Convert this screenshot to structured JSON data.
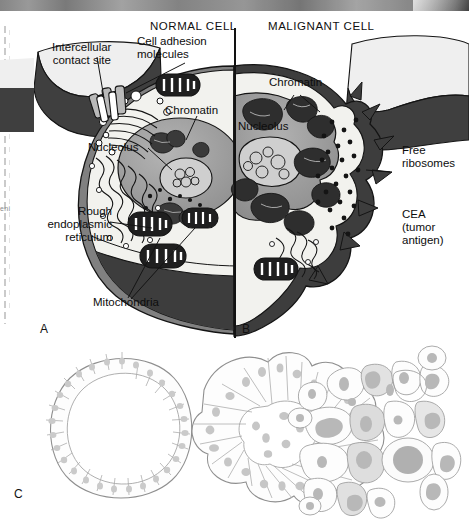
{
  "figure": {
    "title_normal": "NORMAL CELL",
    "title_malignant": "MALIGNANT CELL",
    "panel_labels": {
      "a": "A",
      "b": "B",
      "c": "C"
    },
    "scan_fragment": "eni"
  },
  "labels": {
    "intercellular_contact_site": "Intercellular\ncontact site",
    "cell_adhesion_molecules": "Cell adhesion\nmolecules",
    "chromatin_normal": "Chromatin",
    "chromatin_malignant": "Chromatin",
    "nucleolus_normal": "Nucleolus",
    "nucleolus_malignant": "Nucleolus",
    "rough_endoplasmic_reticulum": "Rough\nendoplasmic\nreticulum",
    "mitochondria": "Mitochondria",
    "free_ribosomes": "Free\nribosomes",
    "cea_tumor_antigen": "CEA\n(tumor\nantigen)"
  },
  "colors": {
    "cytoplasm": "#f2f2ee",
    "nucleus": "#9d9d9d",
    "nucleolus": "#cfcfcf",
    "membrane_dark": "#3d3d3d",
    "membrane_mid": "#808080",
    "adjacent_cell_light": "#efefef",
    "adjacent_cell_dark": "#474747",
    "outline": "#141414",
    "tissue_outline": "#9a9a9a",
    "tissue_nucleus": "#c6c6c6"
  },
  "panel_c": {
    "tissue_normal": "normal columnar epithelium",
    "tissue_dysplastic": "dysplastic epithelium",
    "tissue_anaplastic": "anaplastic tumor cells"
  }
}
